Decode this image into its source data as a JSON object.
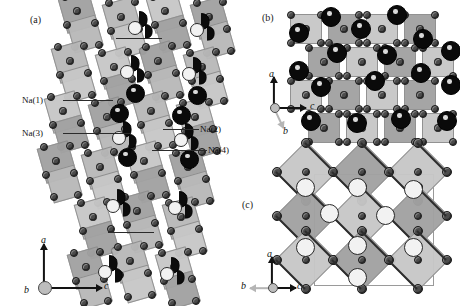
{
  "figure": {
    "width": 460,
    "height": 306,
    "background": "#ffffff",
    "type": "crystal-structure-figure"
  },
  "panels": [
    {
      "id": "a",
      "label": "(a)",
      "label_x": 30,
      "label_y": 14
    },
    {
      "id": "b",
      "label": "(b)",
      "label_x": 262,
      "label_y": 12
    },
    {
      "id": "c",
      "label": "(c)",
      "label_x": 242,
      "label_y": 199
    }
  ],
  "annotations": {
    "left": [
      {
        "text": "Na(1)",
        "x": 22,
        "y": 95,
        "leader_x": 63,
        "leader_y": 100,
        "leader_w": 50
      },
      {
        "text": "Na(3)",
        "x": 22,
        "y": 128,
        "leader_x": 63,
        "leader_y": 133,
        "leader_w": 68
      }
    ],
    "right": [
      {
        "text": "Na(2)",
        "x": 200,
        "y": 124,
        "leader_x": 163,
        "leader_y": 129,
        "leader_w": 36
      },
      {
        "text": "Na(4)",
        "x": 208,
        "y": 145,
        "leader_x": 152,
        "leader_y": 150,
        "leader_w": 55
      }
    ]
  },
  "axes": [
    {
      "panel": "a",
      "origin_x": 44,
      "origin_y": 287,
      "labels": {
        "a": "a",
        "b": "b",
        "c": "c"
      },
      "a_label_x": 41,
      "a_label_y": 241,
      "b_label_x": 26,
      "b_label_y": 281,
      "c_label_x": 104,
      "c_label_y": 281
    },
    {
      "panel": "b",
      "origin_x": 274,
      "origin_y": 107,
      "labels": {
        "a": "a",
        "b": "b",
        "c": "c"
      },
      "a_label_x": 270,
      "a_label_y": 74,
      "b_label_x": 283,
      "b_label_y": 127,
      "c_label_x": 311,
      "c_label_y": 101
    },
    {
      "panel": "c",
      "origin_x": 272,
      "origin_y": 287,
      "labels": {
        "a": "a",
        "b": "b",
        "c": "c"
      },
      "a_label_x": 268,
      "a_label_y": 254,
      "b_label_x": 243,
      "b_label_y": 281,
      "c_label_x": 297,
      "c_label_y": 281
    }
  ],
  "legend_colors": {
    "octahedron_fill": "#b9b9b9",
    "octahedron_edge": "#8e8e8e",
    "oxygen_atom": "#4b4b4b",
    "sodium_full": "#0a0a0a",
    "sodium_partial": "#f2f2f2",
    "axis_arrow": "#121212"
  }
}
